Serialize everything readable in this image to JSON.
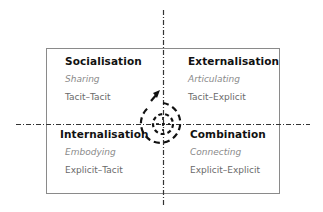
{
  "diagram": {
    "type": "SECI knowledge conversion model",
    "quadrants": [
      {
        "id": "top-left",
        "title": "Socialisation",
        "verb": "Sharing",
        "conversion": "Tacit–Tacit"
      },
      {
        "id": "top-right",
        "title": "Externalisation",
        "verb": "Articulating",
        "conversion": "Tacit–Explicit"
      },
      {
        "id": "bottom-left",
        "title": "Internalisation",
        "verb": "Embodying",
        "conversion": "Explicit–Tacit"
      },
      {
        "id": "bottom-right",
        "title": "Combination",
        "verb": "Connecting",
        "conversion": "Explicit–Explicit"
      }
    ],
    "center": {
      "shape": "dashed-spiral-arrow",
      "direction": "outward-upward"
    },
    "axes": {
      "style": "dash-dot",
      "color": "#333333"
    },
    "frame_color": "#8a8a8a"
  }
}
